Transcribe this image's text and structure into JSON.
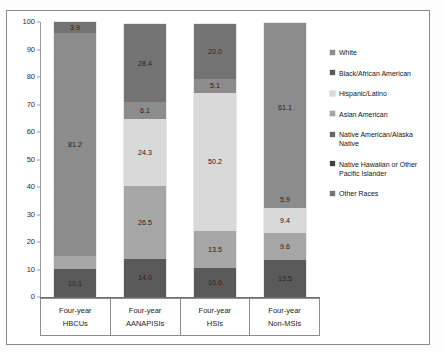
{
  "chart_data": {
    "type": "bar",
    "subtype": "stacked-bar-100",
    "title": "",
    "xlabel": "",
    "ylabel": "",
    "ylim": [
      0,
      100
    ],
    "yticks": [
      0,
      10,
      20,
      30,
      40,
      50,
      60,
      70,
      80,
      90,
      100
    ],
    "ytick_labels": [
      "0",
      "10",
      "20",
      "30",
      "40",
      "50",
      "60",
      "70",
      "80",
      "90",
      "100"
    ],
    "grid": false,
    "legend_position": "right",
    "categories": [
      {
        "line1": "Four-year",
        "line2": "HBCUs"
      },
      {
        "line1": "Four-year",
        "line2": "AANAPISIs"
      },
      {
        "line1": "Four-year",
        "line2": "HSIs"
      },
      {
        "line1": "Four-year",
        "line2": "Non-MSIs"
      }
    ],
    "series": [
      {
        "name": "Black/African American",
        "color": "#595959",
        "values": [
          10.1,
          14.0,
          10.6,
          13.5
        ],
        "labels": [
          "10.1",
          "14.0",
          "10.6",
          "13.5"
        ]
      },
      {
        "name": "Hispanic/Latino",
        "color": "#a6a6a6",
        "values": [
          4.8,
          26.5,
          13.5,
          9.6
        ],
        "labels": [
          "",
          "26.5",
          "13.5",
          "9.6"
        ]
      },
      {
        "name": "Asian American",
        "color": "#d9d9d9",
        "values": [
          0.0,
          24.3,
          50.2,
          9.4
        ],
        "labels": [
          "",
          "24.3",
          "50.2",
          "9.4"
        ]
      },
      {
        "name": "Other Races",
        "color": "#8c8c8c",
        "values": [
          0.0,
          6.1,
          5.1,
          5.9
        ],
        "labels": [
          "",
          "6.1",
          "5.1",
          "5.9"
        ]
      },
      {
        "name": "White",
        "color": "#8c8c8c",
        "values": [
          81.2,
          0.0,
          0.0,
          61.1
        ],
        "labels": [
          "81.2",
          "",
          "",
          "61.1"
        ]
      },
      {
        "name": "Top Segment",
        "color": "#737373",
        "values": [
          3.9,
          28.4,
          20.0,
          0.0
        ],
        "labels": [
          "3.9",
          "28.4",
          "20.0",
          ""
        ]
      }
    ],
    "legend_entries": [
      {
        "label": "White",
        "color": "#8c8c8c"
      },
      {
        "label": "Black/African American",
        "color": "#595959"
      },
      {
        "label": "Hispanic/Latino",
        "color": "#d9d9d9"
      },
      {
        "label": "Asian American",
        "color": "#a6a6a6"
      },
      {
        "label": "Native American/Alaska Native",
        "color": "#666666"
      },
      {
        "label": "Native Hawaiian or Other Pacific Islander",
        "color": "#404040"
      },
      {
        "label": "Other Races",
        "color": "#737373"
      }
    ]
  },
  "legend": {
    "items": [
      {
        "label": "White"
      },
      {
        "label": "Black/African American"
      },
      {
        "label": "Hispanic/Latino"
      },
      {
        "label": "Asian American"
      },
      {
        "label": "Native American/Alaska Native"
      },
      {
        "label": "Native Hawaiian or Other Pacific Islander"
      },
      {
        "label": "Other Races"
      }
    ]
  }
}
